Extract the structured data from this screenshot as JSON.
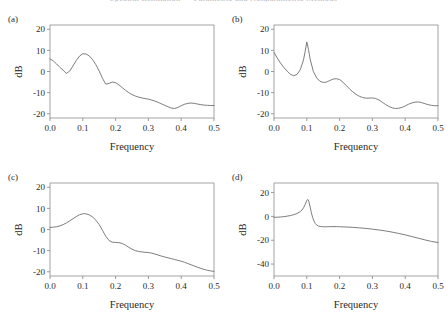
{
  "page": {
    "running_header": "Spectral Estimation — Parametric and Nonparametric Methods",
    "background_color": "#ffffff",
    "line_color": "#6e6e6e",
    "axis_color": "#9a9a9a"
  },
  "common": {
    "xlabel": "Frequency",
    "ylabel": "dB",
    "xticks": [
      "0.0",
      "0.1",
      "0.2",
      "0.3",
      "0.4",
      "0.5"
    ],
    "xtick_values": [
      0.0,
      0.1,
      0.2,
      0.3,
      0.4,
      0.5
    ],
    "xlim": [
      0.0,
      0.5
    ]
  },
  "chart_data": [
    {
      "id": "a",
      "type": "line",
      "tag": "(a)",
      "title": "",
      "xlabel": "Frequency",
      "ylabel": "dB",
      "xlim": [
        0.0,
        0.5
      ],
      "ylim": [
        -22,
        22
      ],
      "yticks": [
        20,
        10,
        0,
        -10,
        -20
      ],
      "ytick_labels": [
        "20",
        "10",
        "0",
        "-10",
        "-20"
      ],
      "grid": false,
      "legend": "none",
      "x": [
        0.0,
        0.01,
        0.02,
        0.03,
        0.04,
        0.05,
        0.06,
        0.07,
        0.08,
        0.09,
        0.1,
        0.11,
        0.12,
        0.13,
        0.14,
        0.15,
        0.16,
        0.17,
        0.18,
        0.19,
        0.2,
        0.21,
        0.22,
        0.23,
        0.24,
        0.25,
        0.26,
        0.27,
        0.28,
        0.29,
        0.3,
        0.31,
        0.32,
        0.33,
        0.34,
        0.35,
        0.36,
        0.37,
        0.38,
        0.39,
        0.4,
        0.41,
        0.42,
        0.43,
        0.44,
        0.45,
        0.46,
        0.47,
        0.48,
        0.49,
        0.5
      ],
      "y": [
        6.0,
        5.0,
        3.6,
        2.0,
        0.6,
        -0.9,
        0.2,
        2.6,
        5.2,
        7.3,
        8.4,
        8.3,
        7.3,
        5.6,
        3.2,
        0.2,
        -3.2,
        -6.0,
        -5.6,
        -5.0,
        -5.3,
        -6.3,
        -7.6,
        -8.9,
        -10.0,
        -10.9,
        -11.6,
        -12.1,
        -12.5,
        -12.8,
        -13.1,
        -13.5,
        -14.0,
        -14.6,
        -15.3,
        -16.0,
        -16.7,
        -17.3,
        -17.5,
        -17.0,
        -16.2,
        -15.5,
        -15.1,
        -14.9,
        -15.1,
        -15.4,
        -15.7,
        -15.9,
        -16.0,
        -16.1,
        -16.1
      ]
    },
    {
      "id": "b",
      "type": "line",
      "tag": "(b)",
      "title": "",
      "xlabel": "Frequency",
      "ylabel": "dB",
      "xlim": [
        0.0,
        0.5
      ],
      "ylim": [
        -22,
        22
      ],
      "yticks": [
        20,
        10,
        0,
        -10,
        -20
      ],
      "ytick_labels": [
        "20",
        "10",
        "0",
        "-10",
        "-20"
      ],
      "grid": false,
      "legend": "none",
      "x": [
        0.0,
        0.01,
        0.02,
        0.03,
        0.04,
        0.05,
        0.06,
        0.07,
        0.08,
        0.09,
        0.095,
        0.1,
        0.105,
        0.11,
        0.12,
        0.13,
        0.14,
        0.15,
        0.16,
        0.17,
        0.18,
        0.19,
        0.2,
        0.21,
        0.22,
        0.23,
        0.24,
        0.25,
        0.26,
        0.27,
        0.28,
        0.29,
        0.3,
        0.31,
        0.32,
        0.33,
        0.34,
        0.35,
        0.36,
        0.37,
        0.38,
        0.39,
        0.4,
        0.41,
        0.42,
        0.43,
        0.44,
        0.45,
        0.46,
        0.47,
        0.48,
        0.49,
        0.5
      ],
      "y": [
        9.0,
        6.4,
        4.0,
        1.9,
        0.2,
        -1.3,
        -2.0,
        -1.4,
        0.8,
        5.5,
        9.5,
        14.0,
        10.5,
        6.0,
        0.0,
        -3.0,
        -4.6,
        -5.2,
        -5.0,
        -4.3,
        -3.6,
        -3.4,
        -3.8,
        -5.0,
        -6.6,
        -8.2,
        -9.6,
        -10.8,
        -11.7,
        -12.3,
        -12.6,
        -12.6,
        -12.5,
        -12.8,
        -13.5,
        -14.5,
        -15.6,
        -16.5,
        -17.2,
        -17.5,
        -17.4,
        -17.0,
        -16.3,
        -15.5,
        -14.9,
        -14.5,
        -14.4,
        -14.7,
        -15.2,
        -15.7,
        -16.0,
        -16.2,
        -16.2
      ]
    },
    {
      "id": "c",
      "type": "line",
      "tag": "(c)",
      "title": "",
      "xlabel": "Frequency",
      "ylabel": "dB",
      "xlim": [
        0.0,
        0.5
      ],
      "ylim": [
        -22,
        22
      ],
      "yticks": [
        20,
        10,
        0,
        -10,
        -20
      ],
      "ytick_labels": [
        "20",
        "10",
        "0",
        "-10",
        "-20"
      ],
      "grid": false,
      "legend": "none",
      "x": [
        0.0,
        0.01,
        0.02,
        0.03,
        0.04,
        0.05,
        0.06,
        0.07,
        0.08,
        0.09,
        0.1,
        0.105,
        0.11,
        0.12,
        0.13,
        0.14,
        0.15,
        0.16,
        0.17,
        0.18,
        0.19,
        0.2,
        0.21,
        0.22,
        0.23,
        0.24,
        0.25,
        0.26,
        0.27,
        0.28,
        0.29,
        0.3,
        0.31,
        0.32,
        0.33,
        0.34,
        0.35,
        0.36,
        0.37,
        0.38,
        0.39,
        0.4,
        0.41,
        0.42,
        0.43,
        0.44,
        0.45,
        0.46,
        0.47,
        0.48,
        0.49,
        0.5
      ],
      "y": [
        1.0,
        1.1,
        1.3,
        1.7,
        2.3,
        3.1,
        4.1,
        5.1,
        6.1,
        7.0,
        7.4,
        7.5,
        7.4,
        6.9,
        5.9,
        4.4,
        2.3,
        -0.4,
        -3.2,
        -5.2,
        -6.0,
        -6.1,
        -6.2,
        -6.6,
        -7.4,
        -8.4,
        -9.3,
        -10.0,
        -10.4,
        -10.6,
        -10.8,
        -10.9,
        -11.2,
        -11.6,
        -12.1,
        -12.6,
        -13.0,
        -13.4,
        -13.8,
        -14.2,
        -14.6,
        -15.0,
        -15.5,
        -16.1,
        -16.7,
        -17.3,
        -17.9,
        -18.4,
        -18.9,
        -19.3,
        -19.6,
        -19.8
      ]
    },
    {
      "id": "d",
      "type": "line",
      "tag": "(d)",
      "title": "",
      "xlabel": "Frequency",
      "ylabel": "dB",
      "xlim": [
        -50,
        28
      ],
      "ylim": [
        -50,
        28
      ],
      "yticks": [
        20,
        0,
        -20,
        -40
      ],
      "ytick_labels": [
        "20",
        "0",
        "-20",
        "-40"
      ],
      "grid": false,
      "legend": "none",
      "x": [
        0.0,
        0.01,
        0.02,
        0.03,
        0.04,
        0.05,
        0.06,
        0.07,
        0.08,
        0.085,
        0.09,
        0.095,
        0.1,
        0.103,
        0.106,
        0.11,
        0.114,
        0.118,
        0.122,
        0.126,
        0.13,
        0.135,
        0.14,
        0.145,
        0.15,
        0.16,
        0.17,
        0.18,
        0.19,
        0.2,
        0.22,
        0.24,
        0.26,
        0.28,
        0.3,
        0.32,
        0.34,
        0.36,
        0.38,
        0.4,
        0.42,
        0.44,
        0.46,
        0.48,
        0.5
      ],
      "y": [
        -0.8,
        -0.7,
        -0.5,
        -0.2,
        0.2,
        0.7,
        1.4,
        2.4,
        4.0,
        5.3,
        7.2,
        10.0,
        13.3,
        14.2,
        12.6,
        8.0,
        3.0,
        -1.0,
        -4.0,
        -6.0,
        -7.2,
        -8.0,
        -8.4,
        -8.6,
        -8.7,
        -8.7,
        -8.6,
        -8.6,
        -8.6,
        -8.7,
        -8.9,
        -9.2,
        -9.6,
        -10.1,
        -10.7,
        -11.4,
        -12.2,
        -13.2,
        -14.3,
        -15.5,
        -16.9,
        -18.3,
        -19.7,
        -21.0,
        -21.9
      ]
    }
  ]
}
